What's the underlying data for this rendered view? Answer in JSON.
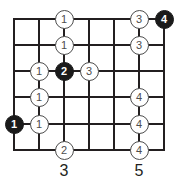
{
  "diagram": {
    "type": "guitar-fretboard-scale-diagram",
    "colors": {
      "grid": "#231f20",
      "marker_open_fill": "#ffffff",
      "marker_open_stroke": "#4d4d4d",
      "marker_open_text": "#4d4d4d",
      "marker_root_fill": "#1a1a1a",
      "marker_root_text": "#ffffff",
      "fret_number_text": "#231f20",
      "background": "#ffffff"
    },
    "grid": {
      "strings_count": 6,
      "frets_count": 6,
      "left": 14,
      "top": 19,
      "right": 164,
      "bottom": 150,
      "string_y": [
        19,
        45,
        71,
        97,
        124,
        150
      ],
      "fret_x": [
        14,
        39,
        64,
        89,
        114,
        139,
        164
      ]
    },
    "fret_numbers": [
      {
        "label": "3",
        "x": 64,
        "y": 162
      },
      {
        "label": "5",
        "x": 139,
        "y": 162
      }
    ],
    "markers": [
      {
        "label": "1",
        "style": "open",
        "string": 1,
        "x": 64,
        "y": 19
      },
      {
        "label": "3",
        "style": "open",
        "string": 1,
        "x": 139,
        "y": 19
      },
      {
        "label": "4",
        "style": "root",
        "string": 1,
        "x": 164,
        "y": 19
      },
      {
        "label": "1",
        "style": "open",
        "string": 2,
        "x": 64,
        "y": 45
      },
      {
        "label": "3",
        "style": "open",
        "string": 2,
        "x": 139,
        "y": 45
      },
      {
        "label": "1",
        "style": "open",
        "string": 3,
        "x": 39,
        "y": 71
      },
      {
        "label": "2",
        "style": "root",
        "string": 3,
        "x": 64,
        "y": 71
      },
      {
        "label": "3",
        "style": "open",
        "string": 3,
        "x": 89,
        "y": 71
      },
      {
        "label": "1",
        "style": "open",
        "string": 4,
        "x": 39,
        "y": 97
      },
      {
        "label": "4",
        "style": "open",
        "string": 4,
        "x": 139,
        "y": 97
      },
      {
        "label": "1",
        "style": "root",
        "string": 5,
        "x": 14,
        "y": 124
      },
      {
        "label": "1",
        "style": "open",
        "string": 5,
        "x": 39,
        "y": 124
      },
      {
        "label": "4",
        "style": "open",
        "string": 5,
        "x": 139,
        "y": 124
      },
      {
        "label": "2",
        "style": "open",
        "string": 6,
        "x": 64,
        "y": 150
      },
      {
        "label": "4",
        "style": "open",
        "string": 6,
        "x": 139,
        "y": 150
      }
    ]
  }
}
